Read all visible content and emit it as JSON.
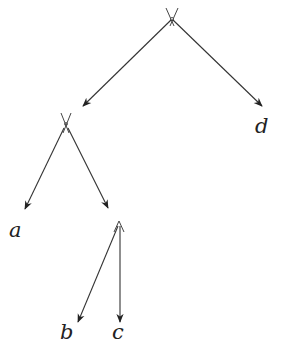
{
  "diagram": {
    "type": "tree",
    "colors": {
      "edge": "#333333",
      "label": "#222222",
      "background": "#ffffff"
    },
    "nodes": [
      {
        "id": "root",
        "x": 172,
        "y": 18,
        "marker": "cross"
      },
      {
        "id": "n1",
        "x": 66,
        "y": 124,
        "marker": "cross"
      },
      {
        "id": "n2",
        "x": 119,
        "y": 219,
        "marker": "caret"
      }
    ],
    "leaves": [
      {
        "id": "a",
        "label": "a",
        "x": 17,
        "y": 232
      },
      {
        "id": "b",
        "label": "b",
        "x": 67,
        "y": 337
      },
      {
        "id": "c",
        "label": "c",
        "x": 119,
        "y": 337
      },
      {
        "id": "d",
        "label": "d",
        "x": 263,
        "y": 131
      }
    ],
    "edges": [
      {
        "from": "root",
        "to": "n1"
      },
      {
        "from": "root",
        "to": "d"
      },
      {
        "from": "n1",
        "to": "a"
      },
      {
        "from": "n1",
        "to": "n2"
      },
      {
        "from": "n2",
        "to": "b"
      },
      {
        "from": "n2",
        "to": "c"
      }
    ]
  }
}
